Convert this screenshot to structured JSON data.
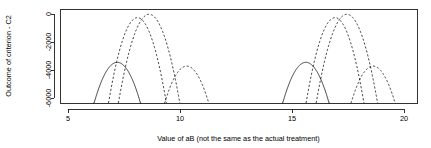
{
  "chart_data": {
    "type": "line",
    "title": "",
    "xlabel": "Value of aB (not the same as the actual treatment)",
    "ylabel": "Outcome of criterion - C2",
    "xlim": [
      4.25,
      20.6
    ],
    "ylim": [
      -6450,
      300
    ],
    "xticks": [
      5,
      10,
      15,
      20
    ],
    "xtick_labels": [
      "5",
      "10",
      "15",
      "20"
    ],
    "yticks": [
      0,
      -2000,
      -4000,
      -6000
    ],
    "ytick_labels": [
      "0",
      "-2000",
      "-4000",
      "-6000"
    ],
    "grid": false,
    "legend": "none",
    "clip_bottom": -6450,
    "series": [
      {
        "name": "curve-1-solid-left",
        "style": "solid",
        "shape": "downward-parabola",
        "peak_x": 7.2,
        "peak_y": -3450,
        "half_width": 1.05
      },
      {
        "name": "curve-2-dashed-left-tall-a",
        "style": "dashed",
        "shape": "downward-parabola",
        "peak_x": 8.1,
        "peak_y": -260,
        "half_width": 1.3
      },
      {
        "name": "curve-3-dashed-left-tall-b",
        "style": "dashed",
        "shape": "downward-parabola",
        "peak_x": 8.62,
        "peak_y": -20,
        "half_width": 1.38
      },
      {
        "name": "curve-4-dashed-left-short",
        "style": "dashed",
        "shape": "downward-parabola",
        "peak_x": 10.3,
        "peak_y": -3720,
        "half_width": 1.0
      },
      {
        "name": "curve-5-solid-right",
        "style": "solid",
        "shape": "downward-parabola",
        "peak_x": 15.62,
        "peak_y": -3450,
        "half_width": 1.05
      },
      {
        "name": "curve-6-dashed-right-tall-a",
        "style": "dashed",
        "shape": "downward-parabola",
        "peak_x": 16.92,
        "peak_y": -260,
        "half_width": 1.3
      },
      {
        "name": "curve-7-dashed-right-tall-b",
        "style": "dashed",
        "shape": "downward-parabola",
        "peak_x": 17.45,
        "peak_y": -20,
        "half_width": 1.38
      },
      {
        "name": "curve-8-dashed-right-short",
        "style": "dashed",
        "shape": "downward-parabola",
        "peak_x": 18.62,
        "peak_y": -3720,
        "half_width": 1.0
      }
    ]
  },
  "plot_geometry": {
    "frame_left_px": 60,
    "frame_right_px": 417,
    "frame_top_px": 9,
    "frame_bottom_px": 103,
    "x_at_5_px": 68,
    "x_at_20_px": 404,
    "y_at_0_px": 14,
    "y_at_minus6000_px": 98
  },
  "colors": {
    "axis": "#000000",
    "curve": "#000000",
    "background": "#ffffff"
  }
}
